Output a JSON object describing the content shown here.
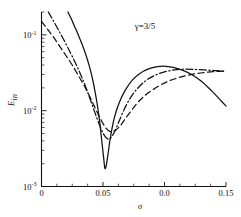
{
  "chart_data": {
    "type": "line",
    "title": "",
    "annotation": "γ=3/5",
    "xlabel": "σ",
    "ylabel": "E",
    "ylabel_sub": "in",
    "yscale": "log",
    "xscale": "linear",
    "xlim": [
      0,
      0.15
    ],
    "ylim": [
      0.001,
      0.2
    ],
    "grid": false,
    "legend": "none",
    "xticks": [
      0,
      0.05,
      0.1,
      0.15
    ],
    "xtick_labels": [
      "0",
      "0.05",
      "0.0",
      "0.15"
    ],
    "xminor_ticks": [
      0.0125,
      0.025,
      0.0375,
      0.0625,
      0.075,
      0.0875,
      0.1125,
      0.125,
      0.1375
    ],
    "yticks": [
      0.001,
      0.01,
      0.1
    ],
    "ytick_labels": [
      "10⁻³",
      "10⁻²",
      "10⁻¹"
    ],
    "ytick_mantissas": [
      "10",
      "10",
      "10"
    ],
    "ytick_exponents": [
      "-3",
      "-2",
      "-1"
    ],
    "series": [
      {
        "name": "solid",
        "style": "solid",
        "x": [
          0.0215,
          0.024,
          0.027,
          0.03,
          0.033,
          0.036,
          0.039,
          0.042,
          0.045,
          0.047,
          0.049,
          0.0505,
          0.0515,
          0.0525,
          0.054,
          0.056,
          0.059,
          0.063,
          0.068,
          0.074,
          0.08,
          0.087,
          0.094,
          0.101,
          0.108,
          0.115,
          0.122,
          0.13,
          0.138,
          0.146,
          0.15
        ],
        "y": [
          0.2,
          0.165,
          0.128,
          0.099,
          0.075,
          0.055,
          0.038,
          0.024,
          0.013,
          0.0078,
          0.004,
          0.0024,
          0.00175,
          0.00185,
          0.0026,
          0.0044,
          0.0078,
          0.0125,
          0.0185,
          0.0255,
          0.031,
          0.0355,
          0.038,
          0.0385,
          0.037,
          0.034,
          0.03,
          0.0245,
          0.0185,
          0.0135,
          0.0115
        ]
      },
      {
        "name": "dash-dot",
        "style": "dashdot",
        "x": [
          0.0055,
          0.009,
          0.013,
          0.017,
          0.021,
          0.025,
          0.029,
          0.033,
          0.037,
          0.041,
          0.045,
          0.049,
          0.052,
          0.055,
          0.058,
          0.06,
          0.063,
          0.067,
          0.072,
          0.078,
          0.085,
          0.092,
          0.1,
          0.108,
          0.116,
          0.124,
          0.132,
          0.14,
          0.147,
          0.15
        ],
        "y": [
          0.2,
          0.16,
          0.122,
          0.093,
          0.07,
          0.052,
          0.038,
          0.027,
          0.0185,
          0.0122,
          0.008,
          0.0055,
          0.0045,
          0.0042,
          0.0048,
          0.0055,
          0.0072,
          0.0102,
          0.0145,
          0.0196,
          0.025,
          0.0292,
          0.0325,
          0.0345,
          0.0352,
          0.035,
          0.0345,
          0.0338,
          0.0333,
          0.0332
        ]
      },
      {
        "name": "dashed",
        "style": "dashed",
        "x": [
          0.0,
          0.005,
          0.01,
          0.015,
          0.02,
          0.025,
          0.03,
          0.035,
          0.04,
          0.044,
          0.048,
          0.052,
          0.056,
          0.06,
          0.064,
          0.068,
          0.073,
          0.079,
          0.086,
          0.094,
          0.102,
          0.11,
          0.118,
          0.126,
          0.134,
          0.142,
          0.15
        ],
        "y": [
          0.15,
          0.118,
          0.092,
          0.07,
          0.053,
          0.04,
          0.029,
          0.021,
          0.0145,
          0.0105,
          0.0078,
          0.006,
          0.0053,
          0.0055,
          0.0063,
          0.0078,
          0.01,
          0.0132,
          0.0168,
          0.0205,
          0.024,
          0.0268,
          0.029,
          0.0308,
          0.032,
          0.0328,
          0.0332
        ]
      }
    ]
  }
}
